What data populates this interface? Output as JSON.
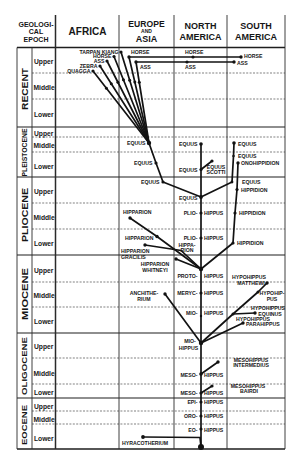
{
  "figure": {
    "header": {
      "epoch_column": [
        "GEOLOGI-",
        "CAL",
        "EPOCH"
      ],
      "regions": [
        {
          "id": "africa",
          "lines": [
            "AFRICA"
          ]
        },
        {
          "id": "europe_asia",
          "lines": [
            "EUROPE",
            "AND",
            "ASIA"
          ]
        },
        {
          "id": "north_america",
          "lines": [
            "NORTH",
            "AMERICA"
          ]
        },
        {
          "id": "south_america",
          "lines": [
            "SOUTH",
            "AMERICA"
          ]
        }
      ]
    },
    "epochs": [
      {
        "name": "RECENT",
        "substages": [
          "Upper",
          "Middle",
          "Lower"
        ]
      },
      {
        "name": "PLEISTOCENE",
        "substages": [
          "Upper",
          "Middle",
          "Lower"
        ]
      },
      {
        "name": "PLIOCENE",
        "substages": [
          "Upper",
          "Middle",
          "Lower"
        ]
      },
      {
        "name": "MIOCENE",
        "substages": [
          "Upper",
          "Middle",
          "Lower"
        ]
      },
      {
        "name": "OLIGOCENE",
        "substages": [
          "Upper",
          "Middle",
          "Lower"
        ]
      },
      {
        "name": "EOCENE",
        "substages": [
          "Upper",
          "Middle",
          "Lower"
        ]
      }
    ],
    "taxa": [
      {
        "id": "tarpan_kiang",
        "lines": [
          "TARPAN KIANG"
        ],
        "region": "Africa",
        "epoch": "RECENT",
        "substage": "Upper"
      },
      {
        "id": "horse_africa",
        "lines": [
          "HORSE"
        ],
        "region": "Africa",
        "epoch": "RECENT",
        "substage": "Upper"
      },
      {
        "id": "ass_africa",
        "lines": [
          "ASS"
        ],
        "region": "Africa",
        "epoch": "RECENT",
        "substage": "Upper"
      },
      {
        "id": "zebra",
        "lines": [
          "ZEBRA"
        ],
        "region": "Africa",
        "epoch": "RECENT",
        "substage": "Upper"
      },
      {
        "id": "quagga",
        "lines": [
          "QUAGGA"
        ],
        "region": "Africa",
        "epoch": "RECENT",
        "substage": "Upper"
      },
      {
        "id": "horse_europe",
        "lines": [
          "HORSE"
        ],
        "region": "Europe and Asia",
        "epoch": "RECENT",
        "substage": "Upper"
      },
      {
        "id": "horse_na",
        "lines": [
          "HORSE"
        ],
        "region": "North America",
        "epoch": "RECENT",
        "substage": "Upper"
      },
      {
        "id": "horse_sa",
        "lines": [
          "HORSE"
        ],
        "region": "South America",
        "epoch": "RECENT",
        "substage": "Upper"
      },
      {
        "id": "ass_europe",
        "lines": [
          "ASS"
        ],
        "region": "Europe and Asia",
        "epoch": "RECENT",
        "substage": "Upper"
      },
      {
        "id": "ass_na",
        "lines": [
          "ASS"
        ],
        "region": "North America",
        "epoch": "RECENT",
        "substage": "Upper"
      },
      {
        "id": "ass_sa",
        "lines": [
          "ASS"
        ],
        "region": "South America",
        "epoch": "RECENT",
        "substage": "Upper"
      },
      {
        "id": "equus_eu_pm",
        "lines": [
          "EQUUS"
        ],
        "region": "Europe and Asia",
        "epoch": "PLEISTOCENE",
        "substage": "Middle"
      },
      {
        "id": "equus_eu_pl",
        "lines": [
          "EQUUS"
        ],
        "region": "Europe and Asia",
        "epoch": "PLEISTOCENE",
        "substage": "Lower"
      },
      {
        "id": "equus_na_pm",
        "lines": [
          "EQUUS"
        ],
        "region": "North America",
        "epoch": "PLEISTOCENE",
        "substage": "Middle"
      },
      {
        "id": "equus_na_pl",
        "lines": [
          "EQUUS"
        ],
        "region": "North America",
        "epoch": "PLEISTOCENE",
        "substage": "Lower"
      },
      {
        "id": "equus_scotti",
        "lines": [
          "EQUUS",
          "SCOTTI"
        ],
        "region": "North America",
        "epoch": "PLEISTOCENE",
        "substage": "Lower"
      },
      {
        "id": "equus_sa_pm",
        "lines": [
          "EQUUS"
        ],
        "region": "South America",
        "epoch": "PLEISTOCENE",
        "substage": "Middle"
      },
      {
        "id": "equus_sa_pl",
        "lines": [
          "EQUUS"
        ],
        "region": "South America",
        "epoch": "PLEISTOCENE",
        "substage": "Lower"
      },
      {
        "id": "onohippidion",
        "lines": [
          "ONOHIPPIDION"
        ],
        "region": "South America",
        "epoch": "PLEISTOCENE",
        "substage": "Lower"
      },
      {
        "id": "equus_eu_pu",
        "lines": [
          "EQUUS"
        ],
        "region": "Europe and Asia",
        "epoch": "PLIOCENE",
        "substage": "Upper"
      },
      {
        "id": "equus_na_pu",
        "lines": [
          "EQUUS"
        ],
        "region": "North America",
        "epoch": "PLIOCENE",
        "substage": "Upper"
      },
      {
        "id": "equus_sa_pu",
        "lines": [
          "EQUUS"
        ],
        "region": "South America",
        "epoch": "PLIOCENE",
        "substage": "Upper"
      },
      {
        "id": "hippidion_pu",
        "lines": [
          "HIPPIDION"
        ],
        "region": "South America",
        "epoch": "PLIOCENE",
        "substage": "Upper"
      },
      {
        "id": "hipparion_pm",
        "lines": [
          "HIPPARION"
        ],
        "region": "Europe and Asia",
        "epoch": "PLIOCENE",
        "substage": "Middle"
      },
      {
        "id": "pliohippus_pm",
        "lines": [
          "PLIO-",
          "HIPPUS"
        ],
        "region": "North America",
        "epoch": "PLIOCENE",
        "substage": "Middle"
      },
      {
        "id": "hippidion_pm",
        "lines": [
          "HIPPIDION"
        ],
        "region": "South America",
        "epoch": "PLIOCENE",
        "substage": "Middle"
      },
      {
        "id": "hipparion_pl",
        "lines": [
          "HIPPARION"
        ],
        "region": "Europe and Asia",
        "epoch": "PLIOCENE",
        "substage": "Lower"
      },
      {
        "id": "pliohippus_pl",
        "lines": [
          "PLIO-",
          "HIPPUS"
        ],
        "region": "North America",
        "epoch": "PLIOCENE",
        "substage": "Lower"
      },
      {
        "id": "hippidion_pl",
        "lines": [
          "HIPPIDION"
        ],
        "region": "South America",
        "epoch": "PLIOCENE",
        "substage": "Lower"
      },
      {
        "id": "hipparion_gracilis",
        "lines": [
          "HIPPARION",
          "GRACILIS"
        ],
        "region": "Europe and Asia",
        "epoch": "PLIOCENE",
        "substage": "Lower"
      },
      {
        "id": "hipparion_na",
        "lines": [
          "HIPPA-",
          "RION"
        ],
        "region": "North America",
        "epoch": "PLIOCENE",
        "substage": "Lower"
      },
      {
        "id": "hipparion_whitneyi",
        "lines": [
          "HIPPARION",
          "WHITNEYI"
        ],
        "region": "Europe and Asia",
        "epoch": "MIOCENE",
        "substage": "Upper"
      },
      {
        "id": "protohippus",
        "lines": [
          "PROTO-",
          "HIPPUS"
        ],
        "region": "North America",
        "epoch": "MIOCENE",
        "substage": "Upper"
      },
      {
        "id": "hypohippus_matthewi",
        "lines": [
          "HYPOHIPPUS",
          "MATTHEWI"
        ],
        "region": "South America",
        "epoch": "MIOCENE",
        "substage": "Upper"
      },
      {
        "id": "anchitherium",
        "lines": [
          "ANCHITHE-",
          "RIUM"
        ],
        "region": "Europe and Asia",
        "epoch": "MIOCENE",
        "substage": "Middle"
      },
      {
        "id": "merychippus",
        "lines": [
          "MERYC-",
          "HIPPUS"
        ],
        "region": "North America",
        "epoch": "MIOCENE",
        "substage": "Middle"
      },
      {
        "id": "hypohippus_pus",
        "lines": [
          "HYPOHIP-",
          "PUS"
        ],
        "region": "South America",
        "epoch": "MIOCENE",
        "substage": "Middle"
      },
      {
        "id": "miohippus_mm",
        "lines": [
          "MIO-",
          "HIPPUS"
        ],
        "region": "North America",
        "epoch": "MIOCENE",
        "substage": "Lower"
      },
      {
        "id": "hypohippus_equinus",
        "lines": [
          "HYPOHIPPUS",
          "EQUINUS"
        ],
        "region": "South America",
        "epoch": "MIOCENE",
        "substage": "Lower"
      },
      {
        "id": "hypohippus_j",
        "lines": [
          "HYPOHIPPUS"
        ],
        "region": "South America",
        "epoch": "MIOCENE",
        "substage": "Lower"
      },
      {
        "id": "parahippus",
        "lines": [
          "PARAHIPPUS"
        ],
        "region": "South America",
        "epoch": "MIOCENE",
        "substage": "Lower"
      },
      {
        "id": "miohippus_ml",
        "lines": [
          "MIO-",
          "HIPPUS"
        ],
        "region": "North America",
        "epoch": "OLIGOCENE",
        "substage": "Upper"
      },
      {
        "id": "mesohippus_intermedius",
        "lines": [
          "MESOHIPPUS",
          "INTERMEDIUS"
        ],
        "region": "South America",
        "epoch": "OLIGOCENE",
        "substage": "Middle"
      },
      {
        "id": "mesohippus_om",
        "lines": [
          "MESO-",
          "HIPPUS"
        ],
        "region": "North America",
        "epoch": "OLIGOCENE",
        "substage": "Middle"
      },
      {
        "id": "mesohippus_bairdi",
        "lines": [
          "MESOHIPPUS",
          "BAIRDI"
        ],
        "region": "South America",
        "epoch": "OLIGOCENE",
        "substage": "Lower"
      },
      {
        "id": "mesohippus_ol",
        "lines": [
          "MESO-",
          "HIPPUS"
        ],
        "region": "North America",
        "epoch": "OLIGOCENE",
        "substage": "Lower"
      },
      {
        "id": "epihippus",
        "lines": [
          "EPI-",
          "HIPPUS"
        ],
        "region": "North America",
        "epoch": "EOCENE",
        "substage": "Upper"
      },
      {
        "id": "orohippus",
        "lines": [
          "ORO-",
          "HIPPUS"
        ],
        "region": "North America",
        "epoch": "EOCENE",
        "substage": "Middle"
      },
      {
        "id": "eohippus",
        "lines": [
          "EO-",
          "HIPPUS"
        ],
        "region": "North America",
        "epoch": "EOCENE",
        "substage": "Lower"
      },
      {
        "id": "hyracotherium",
        "lines": [
          "HYRACOTHERIUM"
        ],
        "region": "Europe and Asia",
        "epoch": "EOCENE",
        "substage": "Lower"
      },
      {
        "id": "root",
        "lines": [],
        "region": "North America",
        "epoch": "EOCENE",
        "substage": "Lower"
      }
    ],
    "lineages": [
      [
        "quagga",
        "equus_eu_pm"
      ],
      [
        "zebra",
        "equus_eu_pm"
      ],
      [
        "ass_africa",
        "equus_eu_pm"
      ],
      [
        "horse_africa",
        "equus_eu_pm"
      ],
      [
        "tarpan_kiang",
        "equus_eu_pm"
      ],
      [
        "horse_europe",
        "equus_eu_pm"
      ],
      [
        "ass_europe",
        "equus_eu_pm"
      ],
      [
        "horse_europe",
        "horse_na"
      ],
      [
        "horse_na",
        "horse_sa"
      ],
      [
        "ass_europe",
        "ass_na"
      ],
      [
        "ass_na",
        "ass_sa"
      ],
      [
        "equus_eu_pm",
        "equus_eu_pl"
      ],
      [
        "equus_eu_pl",
        "equus_eu_pu"
      ],
      [
        "equus_eu_pu",
        "equus_na_pu"
      ],
      [
        "equus_na_pm",
        "equus_na_pl"
      ],
      [
        "equus_na_pl",
        "equus_na_pu"
      ],
      [
        "equus_na_pl",
        "equus_scotti"
      ],
      [
        "equus_sa_pm",
        "equus_sa_pl"
      ],
      [
        "equus_sa_pl",
        "equus_sa_pu"
      ],
      [
        "equus_sa_pu",
        "equus_na_pu"
      ],
      [
        "onohippidion",
        "hippidion_pu"
      ],
      [
        "hippidion_pu",
        "hippidion_pm"
      ],
      [
        "hippidion_pm",
        "hippidion_pl"
      ],
      [
        "hippidion_pl",
        "protohippus"
      ],
      [
        "equus_na_pu",
        "pliohippus_pm"
      ],
      [
        "pliohippus_pm",
        "pliohippus_pl"
      ],
      [
        "pliohippus_pl",
        "protohippus"
      ],
      [
        "hipparion_pm",
        "hipparion_pl"
      ],
      [
        "hipparion_pl",
        "protohippus"
      ],
      [
        "hipparion_gracilis",
        "protohippus"
      ],
      [
        "hipparion_whitneyi",
        "protohippus"
      ],
      [
        "protohippus",
        "merychippus"
      ],
      [
        "merychippus",
        "miohippus_mm"
      ],
      [
        "miohippus_mm",
        "miohippus_ml"
      ],
      [
        "anchitherium",
        "miohippus_ml"
      ],
      [
        "hypohippus_matthewi",
        "hypohippus_pus"
      ],
      [
        "hypohippus_pus",
        "hypohippus_j"
      ],
      [
        "hypohippus_j",
        "miohippus_ml"
      ],
      [
        "hypohippus_j",
        "hypohippus_equinus"
      ],
      [
        "parahippus",
        "miohippus_ml"
      ],
      [
        "miohippus_ml",
        "mesohippus_om"
      ],
      [
        "mesohippus_intermedius",
        "mesohippus_om"
      ],
      [
        "mesohippus_om",
        "mesohippus_ol"
      ],
      [
        "mesohippus_bairdi",
        "mesohippus_ol"
      ],
      [
        "mesohippus_ol",
        "epihippus"
      ],
      [
        "epihippus",
        "orohippus"
      ],
      [
        "orohippus",
        "eohippus"
      ],
      [
        "eohippus",
        "root"
      ],
      [
        "hyracotherium",
        "root"
      ]
    ]
  }
}
